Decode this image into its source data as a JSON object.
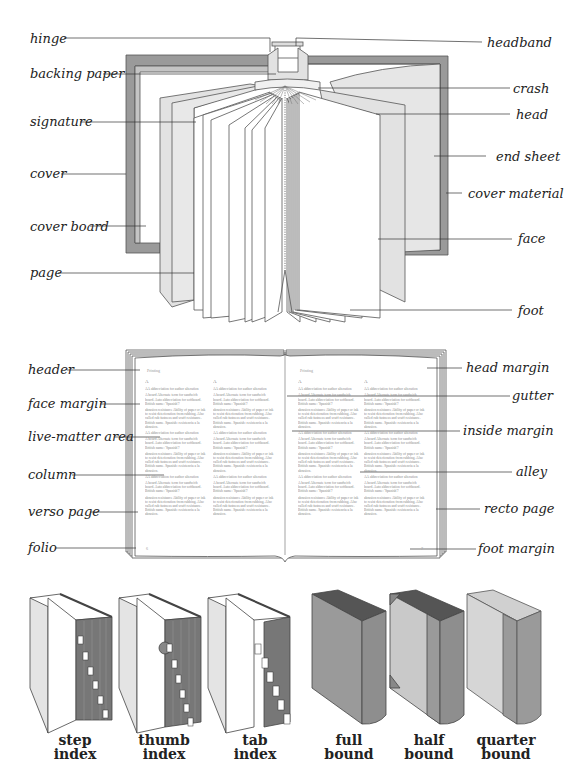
{
  "figure1": {
    "title": "Book anatomy (parts of a bound book)",
    "labels_left": [
      "hinge",
      "backing paper",
      "signature",
      "cover",
      "cover board",
      "page"
    ],
    "labels_right": [
      "headband",
      "crash",
      "head",
      "end sheet",
      "cover material",
      "face",
      "foot"
    ]
  },
  "figure2": {
    "title": "Page layout of an open book",
    "labels_left": [
      "header",
      "face margin",
      "live-matter area",
      "column",
      "verso page",
      "folio"
    ],
    "labels_right": [
      "head margin",
      "gutter",
      "inside margin",
      "alley",
      "recto page",
      "foot margin"
    ],
    "running_head": "Printing",
    "letter_heading": "A",
    "entry_1": "AA abbreviation for author alteration",
    "entry_2": "A board Alternate term for sandwich board. Auto abbreviation for softboard. British name: 'Spanish'?",
    "entry_3": "abrasion resistance Ability of paper or ink to resist deterioration from rubbing. Also called rub fastness and scuff resistance. British name. Spanish: resistencia a la abrasion.",
    "folio_left": "6",
    "folio_right": "7"
  },
  "figure3": {
    "title": "Indexes and binding types",
    "items": [
      {
        "caption_line1": "step",
        "caption_line2": "index",
        "tab_letters": [
          "A",
          "B",
          "C",
          "D",
          "E",
          "F",
          "G"
        ]
      },
      {
        "caption_line1": "thumb",
        "caption_line2": "index",
        "tab_letters": [
          "A",
          "B",
          "C",
          "D",
          "E",
          "F",
          "G"
        ]
      },
      {
        "caption_line1": "tab",
        "caption_line2": "index",
        "tab_letters": [
          "A",
          "B",
          "C",
          "D",
          "E",
          "F",
          "G"
        ]
      },
      {
        "caption_line1": "full",
        "caption_line2": "bound"
      },
      {
        "caption_line1": "half",
        "caption_line2": "bound"
      },
      {
        "caption_line1": "quarter",
        "caption_line2": "bound"
      }
    ]
  },
  "colors": {
    "cover_gray": "#9a9a9a",
    "cover_light": "#c9c9c9",
    "endsheet": "#e6e6e6",
    "line": "#444444",
    "dark_edge": "#6e6e6e"
  }
}
